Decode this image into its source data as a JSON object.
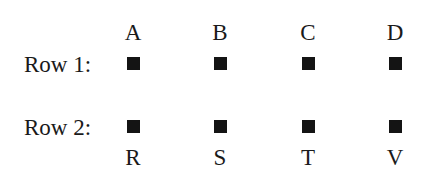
{
  "diagram": {
    "top_labels": [
      "A",
      "B",
      "C",
      "D"
    ],
    "bottom_labels": [
      "R",
      "S",
      "T",
      "V"
    ],
    "rows": [
      {
        "label": "Row 1:",
        "markers": 4
      },
      {
        "label": "Row 2:",
        "markers": 4
      }
    ],
    "marker_color": "#141414"
  }
}
